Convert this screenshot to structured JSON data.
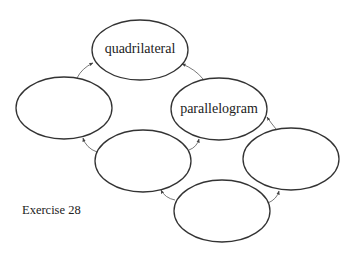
{
  "diagram": {
    "type": "concept-map",
    "nodes": [
      {
        "id": "top",
        "label": "quadrilateral",
        "cx": 140,
        "cy": 50,
        "rx": 48,
        "ry": 30
      },
      {
        "id": "left",
        "label": "",
        "cx": 64,
        "cy": 108,
        "rx": 48,
        "ry": 31
      },
      {
        "id": "parallelogram",
        "label": "parallelogram",
        "cx": 219,
        "cy": 109,
        "rx": 48,
        "ry": 31
      },
      {
        "id": "middle",
        "label": "",
        "cx": 143,
        "cy": 161,
        "rx": 48,
        "ry": 31
      },
      {
        "id": "right",
        "label": "",
        "cx": 291,
        "cy": 159,
        "rx": 48,
        "ry": 31
      },
      {
        "id": "bottom",
        "label": "",
        "cx": 222,
        "cy": 211,
        "rx": 48,
        "ry": 31
      }
    ],
    "edges": [
      {
        "from": "left",
        "to": "top"
      },
      {
        "from": "parallelogram",
        "to": "top"
      },
      {
        "from": "middle",
        "to": "left"
      },
      {
        "from": "middle",
        "to": "parallelogram"
      },
      {
        "from": "right",
        "to": "parallelogram"
      },
      {
        "from": "bottom",
        "to": "middle"
      },
      {
        "from": "bottom",
        "to": "right"
      }
    ]
  },
  "labels": {
    "quadrilateral": "quadrilateral",
    "parallelogram": "parallelogram"
  },
  "caption": "Exercise 28",
  "colors": {
    "stroke": "#333333",
    "arrow": "#555555",
    "background": "#ffffff",
    "text": "#222222"
  }
}
